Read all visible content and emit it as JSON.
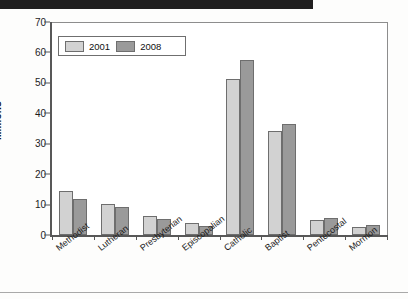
{
  "chart_data": {
    "type": "bar",
    "title": "",
    "subtitle": "",
    "xlabel": "",
    "ylabel": "Millions",
    "ylim": [
      0,
      70
    ],
    "yticks": [
      0,
      10,
      20,
      30,
      40,
      50,
      60,
      70
    ],
    "grid": false,
    "legend_position": "top-left",
    "categories": [
      "Methodist",
      "Lutheran",
      "Presbyterian",
      "Episcopalian",
      "Catholic",
      "Baptist",
      "Pentecostal",
      "Mormon"
    ],
    "series": [
      {
        "name": "2001",
        "color": "#d2d2d2",
        "values": [
          14.5,
          10.1,
          6.2,
          4.0,
          51.2,
          34.3,
          4.8,
          2.7
        ]
      },
      {
        "name": "2008",
        "color": "#9a9a9a",
        "values": [
          12.0,
          9.2,
          5.3,
          3.0,
          57.5,
          36.5,
          5.7,
          3.4
        ]
      }
    ]
  },
  "legend": {
    "entries": [
      {
        "label": "2001"
      },
      {
        "label": "2008"
      }
    ]
  },
  "axes": {
    "y_title": "Millions",
    "y_tick_labels": [
      "70",
      "60",
      "50",
      "40",
      "30",
      "20",
      "10",
      "0"
    ]
  },
  "decor": {
    "header_bar_color": "#201f1f",
    "rule_color": "#a9a9a9"
  }
}
